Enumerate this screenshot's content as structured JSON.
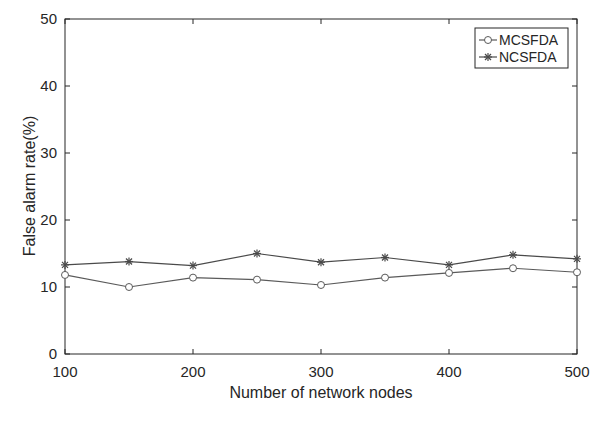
{
  "chart_data": {
    "type": "line",
    "title": "",
    "xlabel": "Number of network nodes",
    "ylabel": "False alarm rate(%)",
    "x": [
      100,
      150,
      200,
      250,
      300,
      350,
      400,
      450,
      500
    ],
    "xlim": [
      100,
      500
    ],
    "ylim": [
      0,
      50
    ],
    "xticks": [
      100,
      200,
      300,
      400,
      500
    ],
    "yticks": [
      0,
      10,
      20,
      30,
      40,
      50
    ],
    "xtick_labels": [
      "100",
      "200",
      "300",
      "400",
      "500"
    ],
    "ytick_labels": [
      "0",
      "10",
      "20",
      "30",
      "40",
      "50"
    ],
    "grid": false,
    "legend_position": "upper right",
    "series": [
      {
        "name": "MCSFDA",
        "marker": "circle",
        "color": "#5a5a5a",
        "values": [
          11.8,
          10.0,
          11.4,
          11.1,
          10.3,
          11.4,
          12.1,
          12.8,
          12.2
        ]
      },
      {
        "name": "NCSFDA",
        "marker": "star",
        "color": "#4a4a4a",
        "values": [
          13.3,
          13.8,
          13.2,
          15.0,
          13.7,
          14.4,
          13.3,
          14.8,
          14.2
        ]
      }
    ]
  }
}
